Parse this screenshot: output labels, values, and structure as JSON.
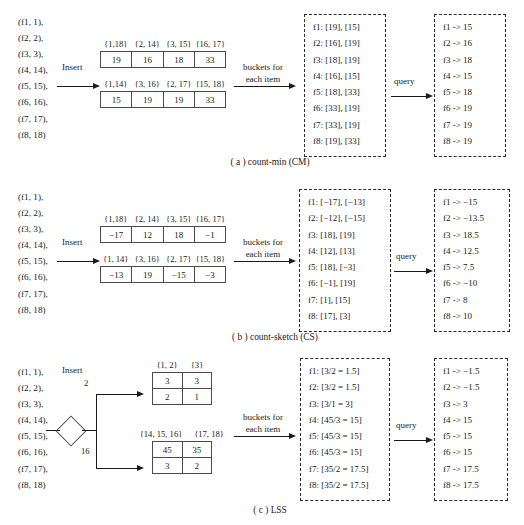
{
  "figure": {
    "stream_items": [
      "(f1, 1),",
      "(f2, 2),",
      "(f3, 3),",
      "(f4, 14),",
      "(f5, 15),",
      "(f6, 16),",
      "(f7, 17),",
      "(f8, 18)"
    ],
    "insert_label": "Insert",
    "buckets_label_line1": "buckets for",
    "buckets_label_line2": "each item",
    "query_label": "query"
  },
  "panel_a": {
    "caption": "( a ) count-min (CM)",
    "row1_keys": [
      "{1,18}",
      "{2, 14}",
      "{3, 15}",
      "{16, 17}"
    ],
    "row1_values": [
      "19",
      "16",
      "18",
      "33"
    ],
    "row2_keys": [
      "{1,14}",
      "{3, 16}",
      "{2, 17}",
      "{15, 18}"
    ],
    "row2_values": [
      "15",
      "19",
      "19",
      "33"
    ],
    "buckets": [
      "f1: [19], [15]",
      "f2: [16], [19]",
      "f3: [18], [19]",
      "f4: [16], [15]",
      "f5: [18], [33]",
      "f6: [33], [19]",
      "f7: [33], [19]",
      "f8: [19], [33]"
    ],
    "results": [
      "f1 -> 15",
      "f2 -> 16",
      "f3 -> 18",
      "f4 -> 15",
      "f5 -> 18",
      "f6 -> 19",
      "f7 -> 19",
      "f8 -> 19"
    ]
  },
  "panel_b": {
    "caption": "( b ) count-sketch (CS)",
    "row1_keys": [
      "{1,18}",
      "{2, 14}",
      "{3, 15}",
      "{16, 17}"
    ],
    "row1_values": [
      "−17",
      "12",
      "18",
      "−1"
    ],
    "row2_keys": [
      "{1, 14}",
      "{3, 16}",
      "{2, 17}",
      "{15, 18}"
    ],
    "row2_values": [
      "−13",
      "19",
      "−15",
      "−3"
    ],
    "buckets": [
      "f1: [−17], [−13]",
      "f2: [−12], [−15]",
      "f3: [18], [19]",
      "f4: [12], [13]",
      "f5: [18], [−3]",
      "f6: [−1], [19]",
      "f7: [1], [15]",
      "f8: [17], [3]"
    ],
    "results": [
      "f1 -> −15",
      "f2 -> −13.5",
      "f3 -> 18.5",
      "f4 -> 12.5",
      "f5 -> 7.5",
      "f6 -> −10",
      "f7 -> 8",
      "f8 -> 10"
    ]
  },
  "panel_c": {
    "caption": "( c ) LSS",
    "edge_label_top": "2",
    "edge_label_bottom": "16",
    "top_table_keys": [
      "{1, 2}",
      "{3}"
    ],
    "top_table_row1": [
      "3",
      "3"
    ],
    "top_table_row2": [
      "2",
      "1"
    ],
    "bottom_table_keys": [
      "{14, 15, 16}",
      "{17, 18}"
    ],
    "bottom_table_row1": [
      "45",
      "35"
    ],
    "bottom_table_row2": [
      "3",
      "2"
    ],
    "buckets": [
      "f1: [3/2 = 1.5]",
      "f2: [3/2 = 1.5]",
      "f3: [3/1 = 3]",
      "f4: [45/3 = 15]",
      "f5: [45/3 = 15]",
      "f6: [45/3 = 15]",
      "f7: [35/2 = 17.5]",
      "f8: [35/2 = 17.5]"
    ],
    "results": [
      "f1 -> −1.5",
      "f2 -> −1.5",
      "f3 -> 3",
      "f4 -> 15",
      "f5 -> 15",
      "f6 -> 15",
      "f7 -> 17.5",
      "f8 -> 17.5"
    ]
  }
}
